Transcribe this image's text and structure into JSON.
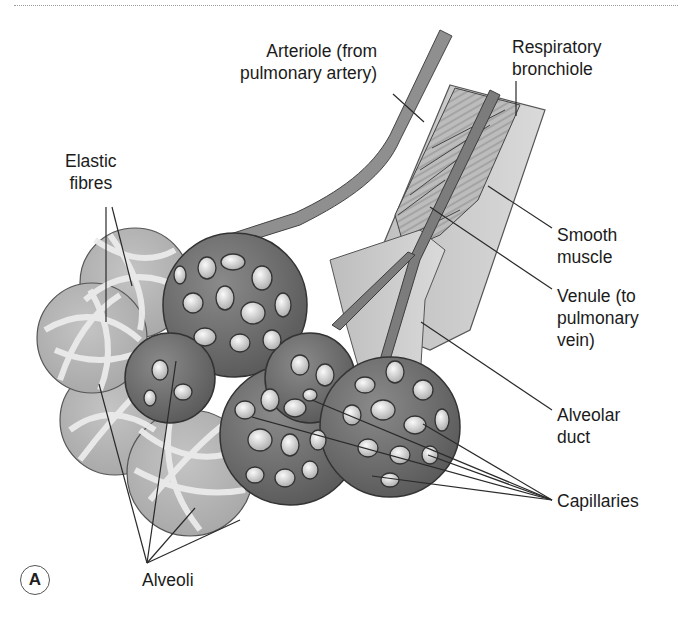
{
  "figure": {
    "panel_letter": "A"
  },
  "labels": {
    "arteriole": [
      "Arteriole (from",
      "pulmonary artery)"
    ],
    "respiratory_bronchiole": [
      "Respiratory",
      "bronchiole"
    ],
    "elastic_fibres": [
      "Elastic",
      "fibres"
    ],
    "smooth_muscle": [
      "Smooth",
      "muscle"
    ],
    "venule": [
      "Venule (to",
      "pulmonary",
      "vein)"
    ],
    "alveolar_duct": [
      "Alveolar",
      "duct"
    ],
    "capillaries": [
      "Capillaries"
    ],
    "alveoli": [
      "Alveoli"
    ]
  },
  "colors": {
    "capillary_net": "#6b6b6b",
    "alveolus_fill": "#b9b9b9",
    "elastic_fibre": "#e6e6e6",
    "vessel": "#8a8a8a",
    "duct": "#cfcfcf",
    "leader_line": "#2a2a2a"
  }
}
